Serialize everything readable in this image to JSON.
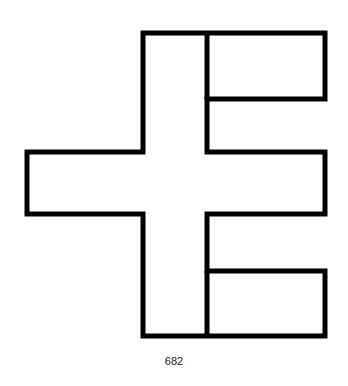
{
  "figure": {
    "number_label": "682",
    "stroke_color": "#000000",
    "background": "#ffffff"
  }
}
